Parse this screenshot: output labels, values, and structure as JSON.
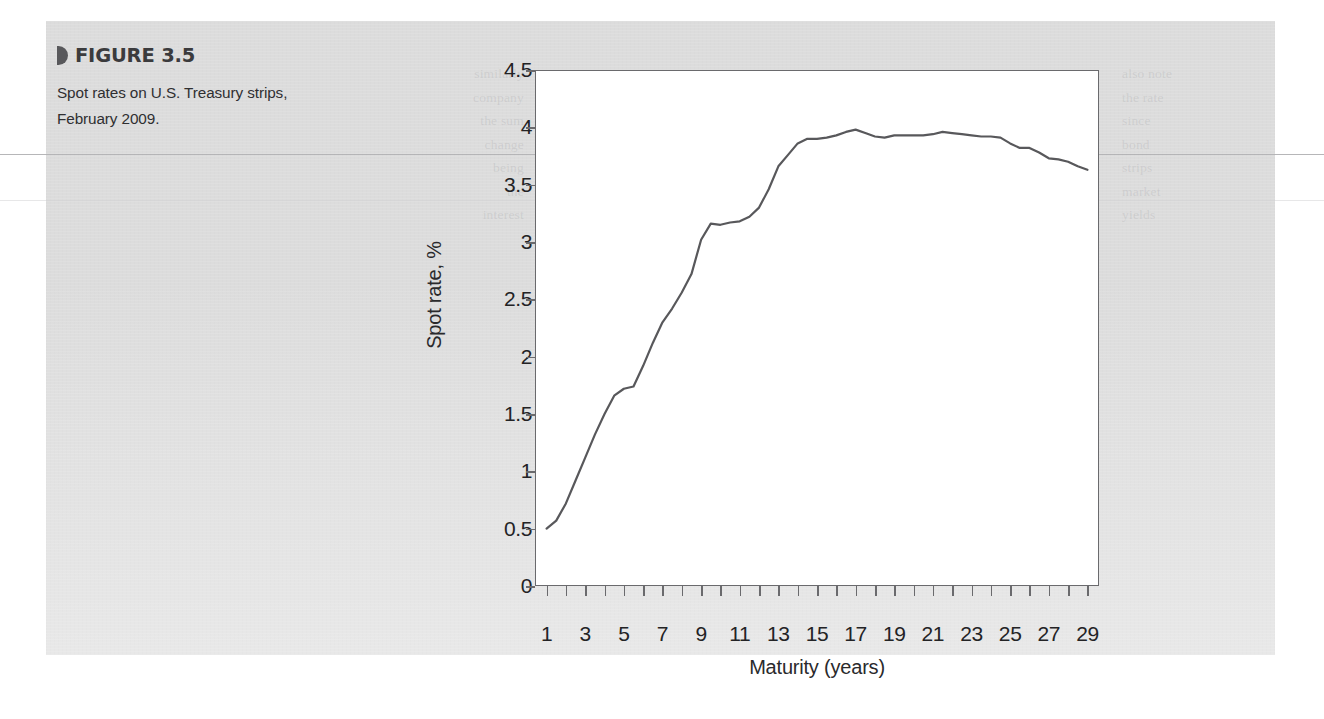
{
  "figure": {
    "marker_icon": "triangle-right-icon",
    "label": "FIGURE 3.5",
    "description": "Spot rates on U.S. Treasury strips, February 2009."
  },
  "colors": {
    "panel_background": "#dcdcdc",
    "plot_background": "#ffffff",
    "axis": "#6a6a6d",
    "series_line": "#58585b",
    "text": "#232325",
    "caption_heading": "#3b3b3d"
  },
  "page_ghost_text": {
    "left_column": "similarly\ncompany\nthe sum\nchange\nbeing\nthe\ninterest",
    "right_column": "also note\nthe rate\nsince\nbond\nstrips\nmarket\nyields"
  },
  "chart_data": {
    "type": "line",
    "title": "Spot rates on U.S. Treasury strips, February 2009.",
    "xlabel": "Maturity (years)",
    "ylabel": "Spot rate, %",
    "xlim": [
      0.4,
      29.6
    ],
    "ylim": [
      0,
      4.5
    ],
    "xticks": [
      1,
      2,
      3,
      4,
      5,
      6,
      7,
      8,
      9,
      10,
      11,
      12,
      13,
      14,
      15,
      16,
      17,
      18,
      19,
      20,
      21,
      22,
      23,
      24,
      25,
      26,
      27,
      28,
      29
    ],
    "xtick_labels_shown": [
      "1",
      "3",
      "5",
      "7",
      "9",
      "11",
      "13",
      "15",
      "17",
      "19",
      "21",
      "23",
      "25",
      "27",
      "29"
    ],
    "yticks": [
      0,
      0.5,
      1,
      1.5,
      2,
      2.5,
      3,
      3.5,
      4,
      4.5
    ],
    "ytick_labels": [
      "0",
      "0.5",
      "1",
      "1.5",
      "2",
      "2.5",
      "3",
      "3.5",
      "4",
      "4.5"
    ],
    "grid": false,
    "legend": null,
    "series": [
      {
        "name": "Spot rate",
        "x": [
          1,
          1.5,
          2,
          2.5,
          3,
          3.5,
          4,
          4.5,
          5,
          5.5,
          6,
          6.5,
          7,
          7.5,
          8,
          8.5,
          9,
          9.5,
          10,
          10.5,
          11,
          11.5,
          12,
          12.5,
          13,
          13.5,
          14,
          14.5,
          15,
          15.5,
          16,
          16.5,
          17,
          17.5,
          18,
          18.5,
          19,
          19.5,
          20,
          20.5,
          21,
          21.5,
          22,
          22.5,
          23,
          23.5,
          24,
          24.5,
          25,
          25.5,
          26,
          26.5,
          27,
          27.5,
          28,
          28.5,
          29
        ],
        "values": [
          0.5,
          0.57,
          0.72,
          0.92,
          1.12,
          1.32,
          1.5,
          1.66,
          1.72,
          1.74,
          1.92,
          2.12,
          2.3,
          2.42,
          2.56,
          2.72,
          3.02,
          3.16,
          3.15,
          3.17,
          3.18,
          3.22,
          3.3,
          3.46,
          3.66,
          3.76,
          3.86,
          3.9,
          3.9,
          3.91,
          3.93,
          3.96,
          3.98,
          3.95,
          3.92,
          3.91,
          3.93,
          3.93,
          3.93,
          3.93,
          3.94,
          3.96,
          3.95,
          3.94,
          3.93,
          3.92,
          3.92,
          3.91,
          3.86,
          3.82,
          3.82,
          3.78,
          3.73,
          3.72,
          3.7,
          3.66,
          3.63
        ]
      }
    ]
  }
}
